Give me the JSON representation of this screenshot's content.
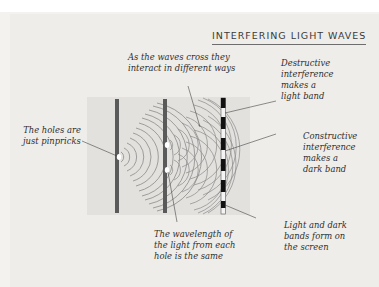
{
  "title": "INTERFERING LIGHT WAVES",
  "labels": {
    "holes": "The holes are\njust pinpricks",
    "cross": "As the waves cross they\ninteract in different ways",
    "destructive": "Destructive\ninterference\nmakes a\nlight band",
    "constructive": "Constructive\ninterference\nmakes a\ndark band",
    "bands": "Light and dark\nbands form on\nthe screen",
    "wavelength": "The wavelength of\nthe light from each\nhole is the same"
  },
  "colors": {
    "panel": "#e2e1de",
    "barrier": "#5a5a5a",
    "wave": "#8a8a8a",
    "screen_dark": "#111111",
    "screen_light": "#f4f4f4"
  }
}
